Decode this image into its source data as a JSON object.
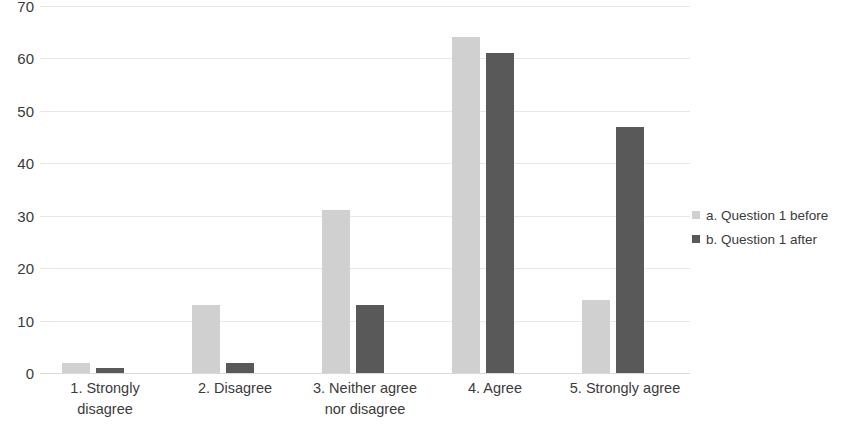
{
  "chart_data": {
    "type": "bar",
    "title": "",
    "subtitle": "",
    "xlabel": "",
    "ylabel": "",
    "ylim": [
      0,
      70
    ],
    "y_ticks": [
      0,
      10,
      20,
      30,
      40,
      50,
      60,
      70
    ],
    "grid": true,
    "legend_position": "right",
    "categories": [
      "1. Strongly disagree",
      "2. Disagree",
      "3. Neither agree nor disagree",
      "4. Agree",
      "5. Strongly agree"
    ],
    "category_lines": [
      [
        "1. Strongly",
        "disagree"
      ],
      [
        "2. Disagree"
      ],
      [
        "3. Neither agree",
        "nor disagree"
      ],
      [
        "4. Agree"
      ],
      [
        "5. Strongly agree"
      ]
    ],
    "series": [
      {
        "name": "a. Question 1 before",
        "color": "#d0d0d0",
        "values": [
          2,
          13,
          31,
          64,
          14
        ]
      },
      {
        "name": "b. Question 1 after",
        "color": "#595959",
        "values": [
          1,
          2,
          13,
          61,
          47
        ]
      }
    ]
  },
  "legend": {
    "items": [
      {
        "label": "a. Question 1 before",
        "color": "#d0d0d0",
        "swatch": "square-marker-icon"
      },
      {
        "label": "b. Question 1 after",
        "color": "#595959",
        "swatch": "square-marker-icon"
      }
    ]
  },
  "colors": {
    "background": "#ffffff",
    "gridline": "#e8e8e8",
    "baseline": "#d9d9d9",
    "text": "#3b3b3b",
    "series_a": "#d0d0d0",
    "series_b": "#595959"
  }
}
